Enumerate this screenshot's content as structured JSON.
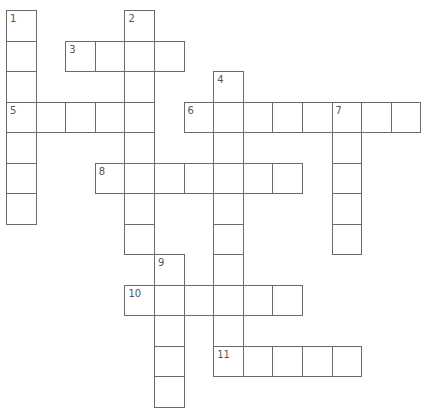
{
  "puzzle": {
    "type": "crossword",
    "grid": {
      "rows": 14,
      "cols": 14,
      "origin_x": 6,
      "origin_y": 10,
      "step_x": 29.6,
      "step_y": 30.5
    },
    "colors": {
      "border": "#6a6a6a",
      "number": "#555555",
      "background": "#ffffff"
    },
    "entries": [
      {
        "number": "1",
        "direction": "down",
        "row": 0,
        "col": 0,
        "length": 7
      },
      {
        "number": "2",
        "direction": "down",
        "row": 0,
        "col": 4,
        "length": 8
      },
      {
        "number": "3",
        "direction": "across",
        "row": 1,
        "col": 2,
        "length": 4
      },
      {
        "number": "4",
        "direction": "down",
        "row": 2,
        "col": 7,
        "length": 10
      },
      {
        "number": "5",
        "direction": "across",
        "row": 3,
        "col": 0,
        "length": 5
      },
      {
        "number": "6",
        "direction": "across",
        "row": 3,
        "col": 6,
        "length": 8
      },
      {
        "number": "7",
        "direction": "down",
        "row": 3,
        "col": 11,
        "length": 5
      },
      {
        "number": "8",
        "direction": "across",
        "row": 5,
        "col": 3,
        "length": 7
      },
      {
        "number": "9",
        "direction": "down",
        "row": 8,
        "col": 5,
        "length": 5
      },
      {
        "number": "10",
        "direction": "across",
        "row": 9,
        "col": 4,
        "length": 6
      },
      {
        "number": "11",
        "direction": "across",
        "row": 11,
        "col": 7,
        "length": 5
      }
    ]
  }
}
